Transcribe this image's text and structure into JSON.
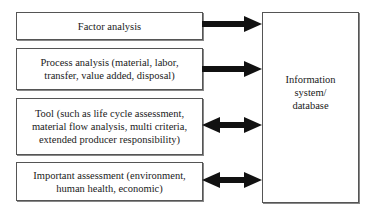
{
  "diagram": {
    "left_boxes": [
      {
        "label": "Factor analysis",
        "arrow": "right"
      },
      {
        "label": "Process analysis (material, labor,\ntransfer, value added, disposal)",
        "arrow": "right"
      },
      {
        "label": "Tool (such as life cycle assessment,\nmaterial flow analysis, multi criteria,\nextended producer responsibility)",
        "arrow": "both"
      },
      {
        "label": "Important assessment (environment,\nhuman health, economic)",
        "arrow": "both"
      }
    ],
    "right_box": {
      "label": "Information\nsystem/\ndatabase"
    }
  }
}
